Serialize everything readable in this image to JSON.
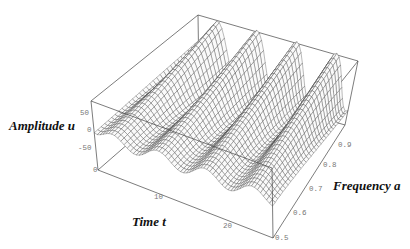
{
  "chart_data": {
    "type": "surface3d",
    "title": "",
    "axes": {
      "x": {
        "label": "Time t",
        "range": [
          0,
          25
        ],
        "ticks": [
          0,
          10,
          20
        ]
      },
      "y": {
        "label": "Frequency a",
        "range": [
          0.5,
          0.95
        ],
        "ticks": [
          0.5,
          0.6,
          0.7,
          0.8,
          0.9
        ]
      },
      "z": {
        "label": "Amplitude u",
        "range": [
          -110,
          85
        ],
        "ticks": [
          -50,
          0,
          50
        ]
      }
    },
    "grid": false,
    "legend": null,
    "style": "wireframe mesh, white fill, dark grey lines, bounding box",
    "mesh": {
      "t_steps": 60,
      "a_steps": 30
    },
    "surface_description": "Oscillating amplitude u(t,a): four ridges along t whose peaks grow with frequency a; near a=0.5 amplitude small (about ±25), near a=0.95 peaks reach about +80 at t≈3, 9, 15, 22.",
    "ridge_peaks_back_edge": [
      {
        "t": 3,
        "u": 55
      },
      {
        "t": 9,
        "u": 70
      },
      {
        "t": 15,
        "u": 78
      },
      {
        "t": 22,
        "u": 82
      }
    ],
    "front_edge_troughs_t": [
      4,
      10,
      16,
      21
    ]
  },
  "labels": {
    "amplitude": "Amplitude  u",
    "frequency": "Frequency  a",
    "time": "Time  t",
    "u_ticks": [
      "50",
      "0",
      "-50"
    ],
    "t_ticks": [
      "0",
      "10",
      "20"
    ],
    "a_ticks": [
      "0.5",
      "0.6",
      "0.7",
      "0.8",
      "0.9"
    ]
  }
}
